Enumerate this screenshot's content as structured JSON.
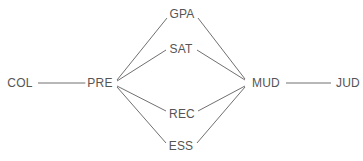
{
  "diagram": {
    "type": "node-link-graph",
    "background_color": "#ffffff",
    "edge_color": "#707070",
    "label_color": "#555555",
    "nodes": [
      {
        "id": "COL",
        "label": "COL",
        "x": 20,
        "y": 83
      },
      {
        "id": "PRE",
        "label": "PRE",
        "x": 100,
        "y": 83
      },
      {
        "id": "GPA",
        "label": "GPA",
        "x": 182,
        "y": 14
      },
      {
        "id": "SAT",
        "label": "SAT",
        "x": 181,
        "y": 49
      },
      {
        "id": "REC",
        "label": "REC",
        "x": 182,
        "y": 114
      },
      {
        "id": "ESS",
        "label": "ESS",
        "x": 181,
        "y": 146
      },
      {
        "id": "MUD",
        "label": "MUD",
        "x": 266,
        "y": 83
      },
      {
        "id": "JUD",
        "label": "JUD",
        "x": 348,
        "y": 83
      }
    ],
    "edges": [
      {
        "from": "COL",
        "to": "PRE",
        "x1": 38,
        "y1": 83,
        "x2": 86,
        "y2": 83
      },
      {
        "from": "PRE",
        "to": "GPA",
        "x1": 117,
        "y1": 80,
        "x2": 167,
        "y2": 18
      },
      {
        "from": "PRE",
        "to": "SAT",
        "x1": 117,
        "y1": 81,
        "x2": 166,
        "y2": 50
      },
      {
        "from": "PRE",
        "to": "REC",
        "x1": 117,
        "y1": 86,
        "x2": 166,
        "y2": 111
      },
      {
        "from": "PRE",
        "to": "ESS",
        "x1": 117,
        "y1": 87,
        "x2": 166,
        "y2": 143
      },
      {
        "from": "GPA",
        "to": "MUD",
        "x1": 198,
        "y1": 18,
        "x2": 245,
        "y2": 79
      },
      {
        "from": "SAT",
        "to": "MUD",
        "x1": 197,
        "y1": 50,
        "x2": 245,
        "y2": 80
      },
      {
        "from": "REC",
        "to": "MUD",
        "x1": 198,
        "y1": 111,
        "x2": 245,
        "y2": 86
      },
      {
        "from": "ESS",
        "to": "MUD",
        "x1": 197,
        "y1": 143,
        "x2": 245,
        "y2": 87
      },
      {
        "from": "MUD",
        "to": "JUD",
        "x1": 286,
        "y1": 83,
        "x2": 331,
        "y2": 83
      }
    ]
  }
}
